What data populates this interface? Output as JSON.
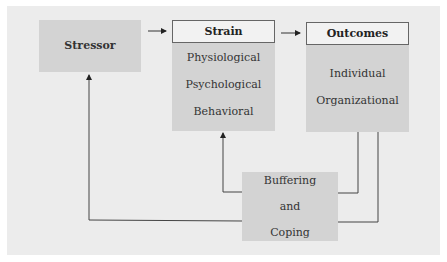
{
  "stressor": {
    "label": "Stressor"
  },
  "strain": {
    "header": "Strain",
    "items": [
      "Physiological",
      "Psychological",
      "Behavioral"
    ]
  },
  "outcomes": {
    "header": "Outcomes",
    "items": [
      "Individual",
      "Organizational"
    ]
  },
  "buffering": {
    "lines": [
      "Buffering",
      "and",
      "Coping"
    ]
  }
}
